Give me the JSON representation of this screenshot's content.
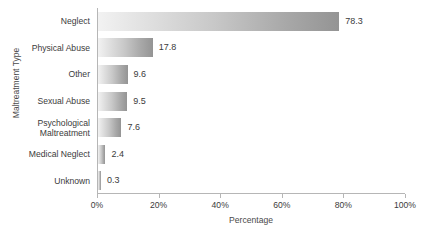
{
  "chart_data": {
    "type": "bar",
    "orientation": "horizontal",
    "title": "",
    "xlabel": "Percentage",
    "ylabel": "Maltreatment Type",
    "categories": [
      "Neglect",
      "Physical Abuse",
      "Other",
      "Sexual Abuse",
      "Psychological Maltreatment",
      "Medical Neglect",
      "Unknown"
    ],
    "values": [
      78.3,
      17.8,
      9.6,
      9.5,
      7.6,
      2.4,
      0.3
    ],
    "value_labels": [
      "78.3",
      "17.8",
      "9.6",
      "9.5",
      "7.6",
      "2.4",
      "0.3"
    ],
    "xlim": [
      0,
      100
    ],
    "xticks": [
      0,
      20,
      40,
      60,
      80,
      100
    ],
    "xtick_labels": [
      "0%",
      "20%",
      "40%",
      "60%",
      "80%",
      "100%"
    ],
    "grid": false,
    "legend": null,
    "bar_gradient_from": "#f2f2f2",
    "bar_gradient_to": "#949494",
    "axis_color": "#b6b6b6",
    "text_color": "#3b3b3b",
    "background": "#ffffff"
  }
}
